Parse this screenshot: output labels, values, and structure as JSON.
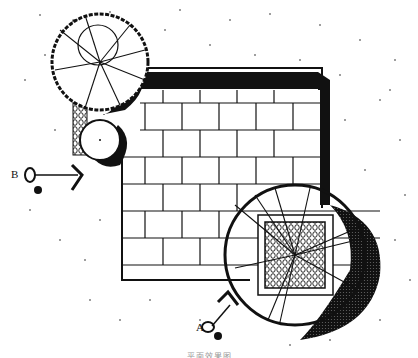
{
  "drawing": {
    "type": "landscape site plan",
    "elements": {
      "paving": "square stone paving grid",
      "trees": [
        "tree canopy top-left",
        "small shrub circle",
        "large tree canopy bottom-right"
      ],
      "inner_planter": "cobble/pebble square planter",
      "walls": "shadowed L-shaped wall along top and right"
    },
    "section_markers": [
      {
        "id": "marker-a",
        "label": "A"
      },
      {
        "id": "marker-b",
        "label": "B"
      }
    ],
    "caption": "平面效果图"
  },
  "colors": {
    "ink": "#111111",
    "paper": "#ffffff"
  }
}
